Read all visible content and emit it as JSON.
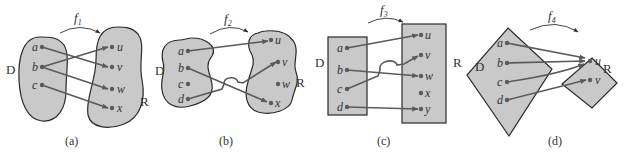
{
  "colors": {
    "region_fill": "#c9c9c9",
    "region_stroke": "#2a2a2a",
    "mapping_line": "#5a5a5a"
  },
  "diagrams": [
    {
      "caption": "(a)",
      "function": {
        "name": "f",
        "subscript": "1"
      },
      "domain_label": "D",
      "range_label": "R",
      "domain_elements": [
        "a",
        "b",
        "c"
      ],
      "range_elements": [
        "u",
        "v",
        "w",
        "x"
      ],
      "mappings": [
        [
          "a",
          "v"
        ],
        [
          "b",
          "u"
        ],
        [
          "b",
          "w"
        ],
        [
          "c",
          "x"
        ]
      ]
    },
    {
      "caption": "(b)",
      "function": {
        "name": "f",
        "subscript": "2"
      },
      "domain_label": "D",
      "range_label": "R",
      "domain_elements": [
        "a",
        "b",
        "c",
        "d"
      ],
      "range_elements": [
        "u",
        "v",
        "w",
        "x"
      ],
      "mappings": [
        [
          "a",
          "u"
        ],
        [
          "b",
          "x"
        ],
        [
          "d",
          "v"
        ]
      ]
    },
    {
      "caption": "(c)",
      "function": {
        "name": "f",
        "subscript": "3"
      },
      "domain_label": "D",
      "range_label": "R",
      "domain_elements": [
        "a",
        "b",
        "c",
        "d"
      ],
      "range_elements": [
        "u",
        "v",
        "w",
        "x",
        "y"
      ],
      "mappings": [
        [
          "a",
          "u"
        ],
        [
          "b",
          "w"
        ],
        [
          "c",
          "v"
        ],
        [
          "d",
          "y"
        ]
      ]
    },
    {
      "caption": "(d)",
      "function": {
        "name": "f",
        "subscript": "4"
      },
      "domain_label": "D",
      "range_label": "R",
      "domain_elements": [
        "a",
        "b",
        "c",
        "d"
      ],
      "range_elements": [
        "u",
        "v"
      ],
      "mappings": [
        [
          "a",
          "u"
        ],
        [
          "b",
          "u"
        ],
        [
          "c",
          "u"
        ],
        [
          "d",
          "v"
        ]
      ]
    }
  ]
}
